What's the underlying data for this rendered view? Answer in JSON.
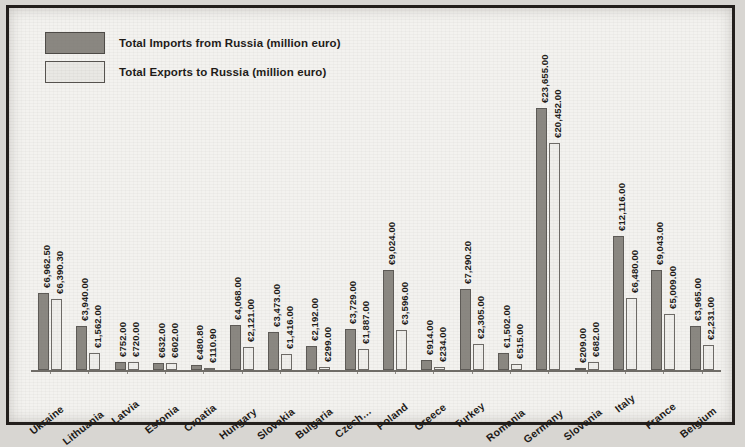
{
  "legend": {
    "imports_label": "Total Imports from Russia (million euro)",
    "exports_label": "Total Exports to Russia (million euro)",
    "imports_color": "#8a8781",
    "exports_color": "#f0efec"
  },
  "chart_data": {
    "type": "bar",
    "title": "",
    "xlabel": "",
    "ylabel": "",
    "ylim": [
      0,
      24000
    ],
    "grid": false,
    "legend_position": "top-left",
    "currency_symbol": "€",
    "categories": [
      "Ukraine",
      "Lithuania",
      "Latvia",
      "Estonia",
      "Croatia",
      "Hungary",
      "Slovakia",
      "Bulgaria",
      "Czech…",
      "Poland",
      "Greece",
      "Turkey",
      "Romania",
      "Germany",
      "Slovenia",
      "Italy",
      "France",
      "Belgium"
    ],
    "series": [
      {
        "name": "Total Imports from Russia (million euro)",
        "values": [
          6962.5,
          3940.0,
          752.0,
          632.0,
          480.8,
          4068.0,
          3473.0,
          2192.0,
          3729.0,
          9024.0,
          914.0,
          7290.2,
          1502.0,
          23655.0,
          209.0,
          12116.0,
          9043.0,
          3965.0
        ],
        "labels": [
          "€6,962.50",
          "€3,940.00",
          "€752.00",
          "€632.00",
          "€480.80",
          "€4,068.00",
          "€3,473.00",
          "€2,192.00",
          "€3,729.00",
          "€9,024.00",
          "€914.00",
          "€7,290.20",
          "€1,502.00",
          "€23,655.00",
          "€209.00",
          "€12,116.00",
          "€9,043.00",
          "€3,965.00"
        ]
      },
      {
        "name": "Total Exports to Russia (million euro)",
        "values": [
          6390.3,
          1562.0,
          720.0,
          602.0,
          110.9,
          2121.0,
          1416.0,
          299.0,
          1887.0,
          3596.0,
          234.0,
          2305.0,
          515.0,
          20452.0,
          682.0,
          6480.0,
          5009.0,
          2231.0
        ],
        "labels": [
          "€6,390.30",
          "€1,562.00",
          "€720.00",
          "€602.00",
          "€110.90",
          "€2,121.00",
          "€1,416.00",
          "€299.00",
          "€1,887.00",
          "€3,596.00",
          "€234.00",
          "€2,305.00",
          "€515.00",
          "€20,452.00",
          "€682.00",
          "€6,480.00",
          "€5,009.00",
          "€2,231.00"
        ]
      }
    ]
  }
}
